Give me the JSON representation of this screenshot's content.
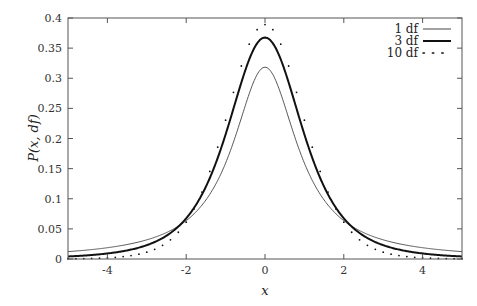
{
  "chart_data": {
    "type": "line",
    "title": "",
    "xlabel": "x",
    "ylabel": "P(x, df)",
    "xlim": [
      -5,
      5
    ],
    "ylim": [
      0,
      0.4
    ],
    "grid": false,
    "legend_position": "top-right",
    "xticks": [
      -4,
      -2,
      0,
      2,
      4
    ],
    "xtick_labels": [
      "-4",
      "-2",
      "0",
      "2",
      "4"
    ],
    "yticks": [
      0,
      0.05,
      0.1,
      0.15,
      0.2,
      0.25,
      0.3,
      0.35,
      0.4
    ],
    "ytick_labels": [
      "0",
      "0.05",
      "0.1",
      "0.15",
      "0.2",
      "0.25",
      "0.3",
      "0.35",
      "0.4"
    ],
    "series": [
      {
        "name": "1 df",
        "df": 1,
        "style": "thin",
        "color": "#444444",
        "x": [
          -5,
          -4,
          -3,
          -2,
          -1,
          0,
          1,
          2,
          3,
          4,
          5
        ],
        "values": [
          0.0122,
          0.0187,
          0.0318,
          0.0637,
          0.1592,
          0.3183,
          0.1592,
          0.0637,
          0.0318,
          0.0187,
          0.0122
        ]
      },
      {
        "name": "3 df",
        "df": 3,
        "style": "thick",
        "color": "#111111",
        "x": [
          -5,
          -4,
          -3,
          -2,
          -1,
          0,
          1,
          2,
          3,
          4,
          5
        ],
        "values": [
          0.0042,
          0.0092,
          0.023,
          0.0675,
          0.2067,
          0.3676,
          0.2067,
          0.0675,
          0.023,
          0.0092,
          0.0042
        ]
      },
      {
        "name": "10 df",
        "df": 10,
        "style": "dotted",
        "color": "#111111",
        "x": [
          -5,
          -4,
          -3,
          -2,
          -1,
          0,
          1,
          2,
          3,
          4,
          5
        ],
        "values": [
          0.0004,
          0.002,
          0.0114,
          0.0611,
          0.2304,
          0.3891,
          0.2304,
          0.0611,
          0.0114,
          0.002,
          0.0004
        ]
      }
    ]
  },
  "legend": {
    "items": [
      "1 df",
      "3 df",
      "10 df"
    ]
  },
  "axes": {
    "xlabel": "x",
    "ylabel": "P(x, df)"
  }
}
